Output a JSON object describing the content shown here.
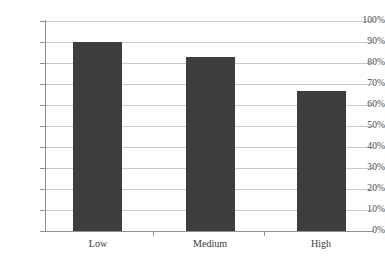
{
  "chart_data": {
    "type": "bar",
    "title": "",
    "subtitle": "",
    "xlabel": "",
    "ylabel": "",
    "categories": [
      "Low",
      "Medium",
      "High"
    ],
    "values": [
      90,
      83,
      66.5
    ],
    "value_labels": [
      "90%",
      "83%",
      "66.5%"
    ],
    "ylim": [
      0,
      100
    ],
    "y_ticks": [
      0,
      10,
      20,
      30,
      40,
      50,
      60,
      70,
      80,
      90,
      100
    ],
    "y_tick_labels": [
      "0%",
      "10%",
      "20%",
      "30%",
      "40%",
      "50%",
      "60%",
      "70%",
      "80%",
      "90%",
      "100%"
    ],
    "grid": "horizontal",
    "legend": "none",
    "series": [
      {
        "name": "",
        "values": [
          90,
          83,
          66.5
        ]
      }
    ],
    "colors": {
      "bar_fill": "#3d3d3d",
      "gridline": "#c8c8c8",
      "axis_line": "#8f8f8f",
      "background": "#ffffff",
      "tick_label": "#4a4a4a"
    }
  }
}
